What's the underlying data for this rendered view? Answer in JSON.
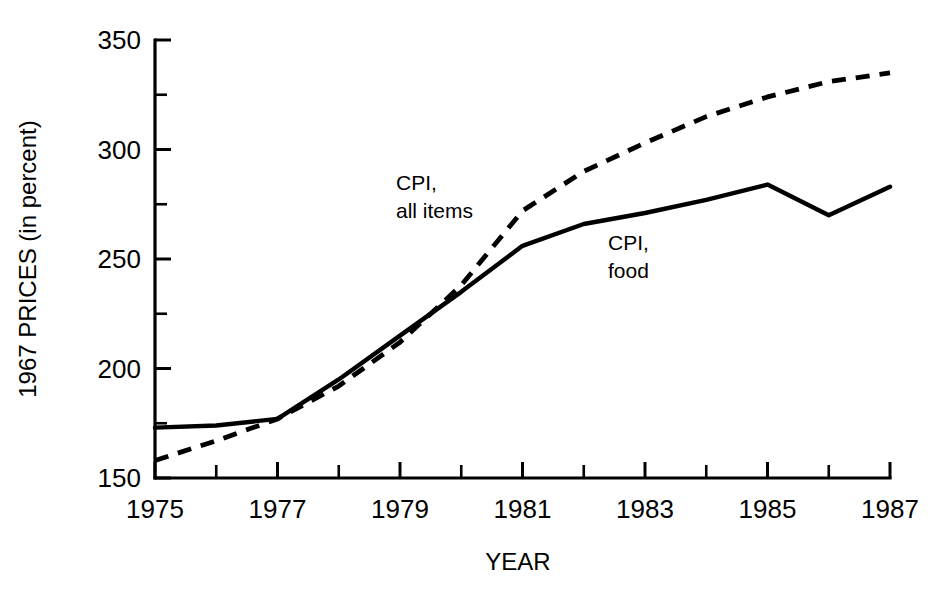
{
  "chart_data": {
    "type": "line",
    "title": "",
    "xlabel": "YEAR",
    "ylabel": "1967 PRICES (in percent)",
    "xlim": [
      1975,
      1987
    ],
    "ylim": [
      150,
      350
    ],
    "grid": false,
    "legend_position": "inline-annotation",
    "x": [
      1975,
      1976,
      1977,
      1978,
      1979,
      1980,
      1981,
      1982,
      1983,
      1984,
      1985,
      1986,
      1987
    ],
    "xtick_labels": [
      "1975",
      "1977",
      "1979",
      "1981",
      "1983",
      "1985",
      "1987"
    ],
    "xtick_values": [
      1975,
      1977,
      1979,
      1981,
      1983,
      1985,
      1987
    ],
    "xtick_minor_values": [
      1976,
      1978,
      1980,
      1982,
      1984,
      1986
    ],
    "ytick_labels": [
      "150",
      "200",
      "250",
      "300",
      "350"
    ],
    "ytick_values": [
      150,
      200,
      250,
      300,
      350
    ],
    "ytick_minor_values": [
      175,
      225,
      275,
      325
    ],
    "series": [
      {
        "name": "CPI, all items",
        "style": "dashed",
        "label_line1": "CPI,",
        "label_line2": "all items",
        "values": [
          158,
          167,
          177,
          192,
          212,
          238,
          272,
          290,
          303,
          315,
          324,
          331,
          335
        ]
      },
      {
        "name": "CPI, food",
        "style": "solid",
        "label_line1": "CPI,",
        "label_line2": "food",
        "values": [
          173,
          174,
          177,
          195,
          215,
          235,
          256,
          266,
          271,
          277,
          284,
          270,
          283
        ]
      }
    ],
    "colors": {
      "line": "#000000",
      "axis": "#000000",
      "background": "#ffffff"
    }
  }
}
